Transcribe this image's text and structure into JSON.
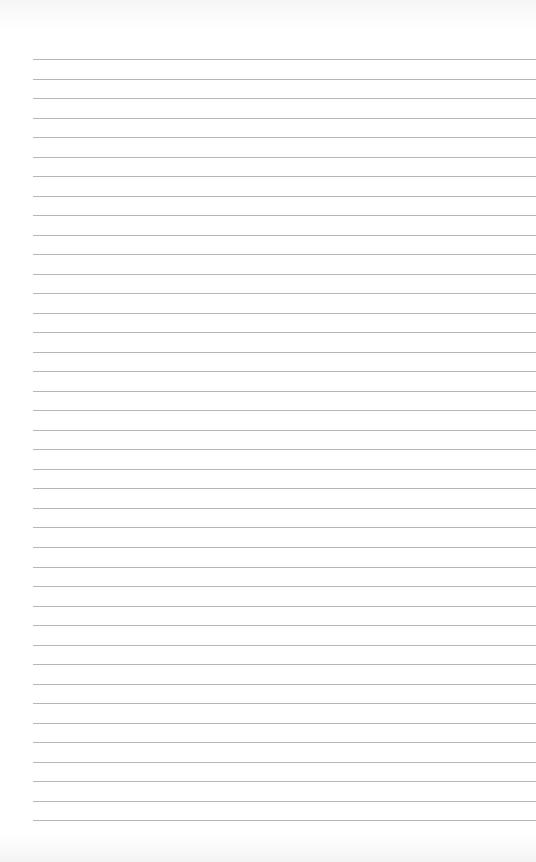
{
  "page": {
    "type": "lined-paper",
    "line_count": 40,
    "first_line_y": 59,
    "line_spacing": 19.52,
    "line_left": 33,
    "line_color": "#a9a9a9",
    "background": "#ffffff"
  }
}
